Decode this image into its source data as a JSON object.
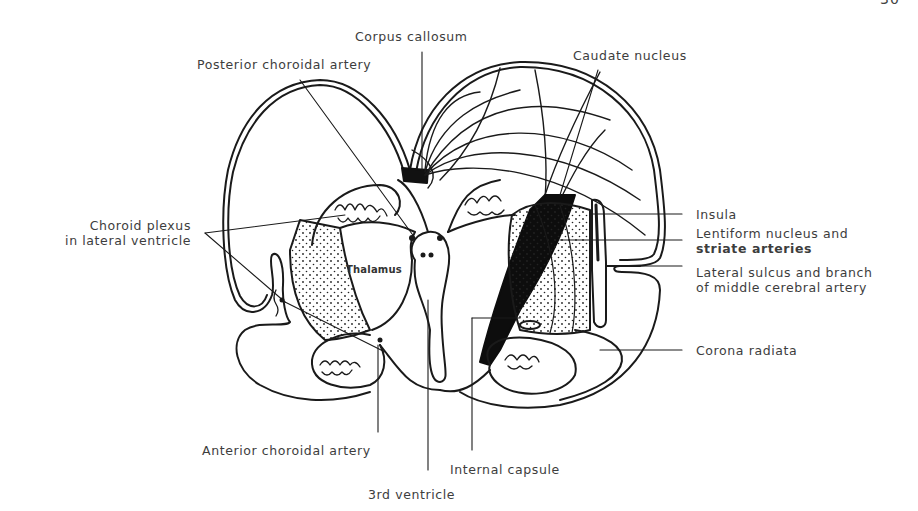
{
  "page": {
    "number_fragment": "30"
  },
  "figure": {
    "labels": {
      "corpus_callosum": "Corpus callosum",
      "posterior_choroidal_artery": "Posterior choroidal artery",
      "caudate_nucleus": "Caudate nucleus",
      "choroid_plexus_line1": "Choroid plexus",
      "choroid_plexus_line2": "in lateral ventricle",
      "thalamus": "Thalamus",
      "insula": "Insula",
      "lentiform_line1": "Lentiform nucleus and",
      "lentiform_line2": "striate arteries",
      "lateral_sulcus_line1": "Lateral sulcus and branch",
      "lateral_sulcus_line2": "of middle cerebral artery",
      "corona_radiata": "Corona radiata",
      "anterior_choroidal_artery": "Anterior choroidal artery",
      "internal_capsule": "Internal capsule",
      "third_ventricle": "3rd ventricle"
    },
    "colors": {
      "ink": "#1a1a1a",
      "text": "#3d3d3d",
      "background": "#ffffff"
    }
  }
}
